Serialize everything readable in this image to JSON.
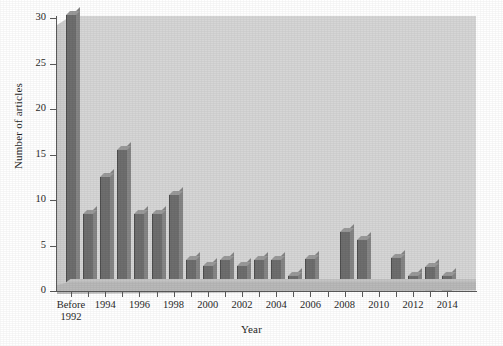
{
  "chart_data": {
    "type": "bar",
    "title": "",
    "xlabel": "Year",
    "ylabel": "Number of articles",
    "ylim": [
      0,
      30
    ],
    "yticks": [
      0,
      5,
      10,
      15,
      20,
      25,
      30
    ],
    "ytick_labels": [
      "0",
      "5",
      "10",
      "15",
      "20",
      "25",
      "30"
    ],
    "grid": false,
    "legend": null,
    "bar_color": "#6e6e6e",
    "plot_background": "#d6d6d6",
    "categories": [
      "Before 1992",
      "1993",
      "1994",
      "1995",
      "1996",
      "1997",
      "1998",
      "1999",
      "2000",
      "2001",
      "2002",
      "2003",
      "2004",
      "2005",
      "2006",
      "2007",
      "2008",
      "2009",
      "2010",
      "2011",
      "2012",
      "2013",
      "2014"
    ],
    "values": [
      30.3,
      8.5,
      12.5,
      15.5,
      8.5,
      8.5,
      10.5,
      3.4,
      2.7,
      3.4,
      2.7,
      3.4,
      3.4,
      1.6,
      3.5,
      0.3,
      6.5,
      5.6,
      0.3,
      3.6,
      1.6,
      2.6,
      1.6
    ],
    "xtick_labels": [
      {
        "category": "Before 1992",
        "text": "Before\n1992"
      },
      {
        "category": "1994",
        "text": "1994"
      },
      {
        "category": "1996",
        "text": "1996"
      },
      {
        "category": "1998",
        "text": "1998"
      },
      {
        "category": "2000",
        "text": "2000"
      },
      {
        "category": "2002",
        "text": "2002"
      },
      {
        "category": "2004",
        "text": "2004"
      },
      {
        "category": "2006",
        "text": "2006"
      },
      {
        "category": "2008",
        "text": "2008"
      },
      {
        "category": "2010",
        "text": "2010"
      },
      {
        "category": "2012",
        "text": "2012"
      },
      {
        "category": "2014",
        "text": "2014"
      }
    ]
  }
}
